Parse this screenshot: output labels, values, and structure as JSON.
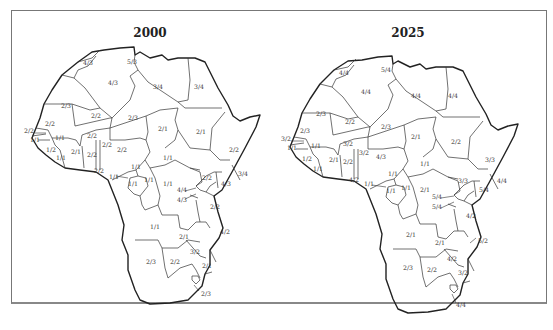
{
  "figure": {
    "panels": [
      {
        "title": "2000",
        "regions": [
          {
            "name": "morocco",
            "code": "4/3",
            "x": 83,
            "y": 65
          },
          {
            "name": "tunisia",
            "code": "5/3",
            "x": 127,
            "y": 64
          },
          {
            "name": "algeria",
            "code": "4/3",
            "x": 108,
            "y": 85
          },
          {
            "name": "libya",
            "code": "3/4",
            "x": 153,
            "y": 89
          },
          {
            "name": "egypt",
            "code": "3/4",
            "x": 194,
            "y": 89
          },
          {
            "name": "western-sahara-mauritania",
            "code": "2/3",
            "x": 61,
            "y": 108
          },
          {
            "name": "mali",
            "code": "2/2",
            "x": 91,
            "y": 118
          },
          {
            "name": "niger",
            "code": "2/3",
            "x": 128,
            "y": 120
          },
          {
            "name": "chad",
            "code": "2/1",
            "x": 158,
            "y": 131
          },
          {
            "name": "sudan",
            "code": "2/1",
            "x": 196,
            "y": 134
          },
          {
            "name": "ethiopia",
            "code": "2/2",
            "x": 229,
            "y": 152
          },
          {
            "name": "senegal",
            "code": "2/2",
            "x": 48,
            "y": 124
          },
          {
            "name": "gambia",
            "code": "2/2",
            "x": 29,
            "y": 131
          },
          {
            "name": "guinea-bissau",
            "code": "1/1",
            "x": 35,
            "y": 139
          },
          {
            "name": "guinea",
            "code": "1/1",
            "x": 57,
            "y": 140
          },
          {
            "name": "sierra-leone",
            "code": "1/2",
            "x": 48,
            "y": 152
          },
          {
            "name": "liberia",
            "code": "1/1",
            "x": 57,
            "y": 160
          },
          {
            "name": "burkina-faso",
            "code": "2/2",
            "x": 89,
            "y": 136
          },
          {
            "name": "cote-divoire",
            "code": "2/1",
            "x": 75,
            "y": 154
          },
          {
            "name": "ghana",
            "code": "2/2",
            "x": 90,
            "y": 156
          },
          {
            "name": "togo-benin",
            "code": "2/2",
            "x": 106,
            "y": 145
          },
          {
            "name": "nigeria",
            "code": "2/2",
            "x": 121,
            "y": 150
          },
          {
            "name": "coast-ghana",
            "code": "2/2",
            "x": 96,
            "y": 173
          },
          {
            "name": "cameroon",
            "code": "1/1",
            "x": 133,
            "y": 169
          },
          {
            "name": "car",
            "code": "1/1",
            "x": 165,
            "y": 160
          },
          {
            "name": "equatorial-guinea",
            "code": "1/1",
            "x": 112,
            "y": 177
          },
          {
            "name": "gabon",
            "code": "1/1",
            "x": 131,
            "y": 185
          },
          {
            "name": "congo",
            "code": "1/1",
            "x": 147,
            "y": 181
          },
          {
            "name": "drc",
            "code": "1/1",
            "x": 165,
            "y": 185
          },
          {
            "name": "uganda",
            "code": "2/2",
            "x": 206,
            "y": 178
          },
          {
            "name": "kenya",
            "code": "4/3",
            "x": 224,
            "y": 185
          },
          {
            "name": "somalia",
            "code": "3/4",
            "x": 243,
            "y": 175
          },
          {
            "name": "rwanda",
            "code": "4/4",
            "x": 181,
            "y": 190
          },
          {
            "name": "burundi",
            "code": "4/3",
            "x": 181,
            "y": 200
          },
          {
            "name": "tanzania",
            "code": "2/2",
            "x": 212,
            "y": 207
          },
          {
            "name": "angola",
            "code": "1/1",
            "x": 154,
            "y": 227
          },
          {
            "name": "zambia",
            "code": "2/1",
            "x": 182,
            "y": 237
          },
          {
            "name": "mozambique",
            "code": "4/2",
            "x": 224,
            "y": 232
          },
          {
            "name": "zimbabwe",
            "code": "3/2",
            "x": 194,
            "y": 252
          },
          {
            "name": "namibia",
            "code": "2/3",
            "x": 150,
            "y": 262
          },
          {
            "name": "botswana",
            "code": "2/2",
            "x": 174,
            "y": 262
          },
          {
            "name": "south-mozambique",
            "code": "2/1",
            "x": 206,
            "y": 266
          },
          {
            "name": "south-africa",
            "code": "2/3",
            "x": 205,
            "y": 294
          }
        ]
      },
      {
        "title": "2025",
        "regions": [
          {
            "name": "morocco",
            "code": "4/4",
            "x": 339,
            "y": 75
          },
          {
            "name": "tunisia",
            "code": "5/4",
            "x": 383,
            "y": 72
          },
          {
            "name": "algeria",
            "code": "4/4",
            "x": 363,
            "y": 93
          },
          {
            "name": "libya",
            "code": "4/4",
            "x": 413,
            "y": 97
          },
          {
            "name": "egypt",
            "code": "4/4",
            "x": 450,
            "y": 97
          },
          {
            "name": "western-sahara-mauritania",
            "code": "2/3",
            "x": 318,
            "y": 114
          },
          {
            "name": "mali",
            "code": "2/2",
            "x": 347,
            "y": 123
          },
          {
            "name": "niger",
            "code": "2/3",
            "x": 383,
            "y": 128
          },
          {
            "name": "chad",
            "code": "2/1",
            "x": 413,
            "y": 138
          },
          {
            "name": "sudan",
            "code": "2/2",
            "x": 453,
            "y": 143
          },
          {
            "name": "ethiopia",
            "code": "3/3",
            "x": 488,
            "y": 161
          },
          {
            "name": "senegal",
            "code": "2/3",
            "x": 302,
            "y": 131
          },
          {
            "name": "gambia",
            "code": "3/2",
            "x": 285,
            "y": 139
          },
          {
            "name": "guinea-bissau",
            "code": "1/1",
            "x": 292,
            "y": 147
          },
          {
            "name": "guinea",
            "code": "1/1",
            "x": 312,
            "y": 146
          },
          {
            "name": "sierra-leone",
            "code": "1/2",
            "x": 305,
            "y": 160
          },
          {
            "name": "liberia",
            "code": "1/1",
            "x": 314,
            "y": 170
          },
          {
            "name": "burkina-faso",
            "code": "3/2",
            "x": 345,
            "y": 146
          },
          {
            "name": "cote-divoire",
            "code": "2/1",
            "x": 331,
            "y": 160
          },
          {
            "name": "ghana",
            "code": "2/2",
            "x": 346,
            "y": 162
          },
          {
            "name": "togo-benin",
            "code": "3/2",
            "x": 362,
            "y": 153
          },
          {
            "name": "nigeria",
            "code": "4/3",
            "x": 379,
            "y": 157
          },
          {
            "name": "coast-ghana",
            "code": "4/2",
            "x": 352,
            "y": 180
          },
          {
            "name": "cameroon",
            "code": "1/1",
            "x": 389,
            "y": 175
          },
          {
            "name": "car",
            "code": "1/1",
            "x": 422,
            "y": 165
          },
          {
            "name": "equatorial-guinea",
            "code": "1/1",
            "x": 368,
            "y": 183
          },
          {
            "name": "gabon",
            "code": "1/1",
            "x": 388,
            "y": 191
          },
          {
            "name": "congo",
            "code": "1/1",
            "x": 403,
            "y": 189
          },
          {
            "name": "drc",
            "code": "2/1",
            "x": 422,
            "y": 191
          },
          {
            "name": "uganda",
            "code": "3/3",
            "x": 463,
            "y": 182
          },
          {
            "name": "kenya",
            "code": "5/4",
            "x": 482,
            "y": 190
          },
          {
            "name": "somalia",
            "code": "4/4",
            "x": 500,
            "y": 182
          },
          {
            "name": "rwanda",
            "code": "5/4",
            "x": 436,
            "y": 197
          },
          {
            "name": "burundi",
            "code": "5/4",
            "x": 436,
            "y": 207
          },
          {
            "name": "tanzania",
            "code": "4/2",
            "x": 467,
            "y": 216
          },
          {
            "name": "angola",
            "code": "2/1",
            "x": 409,
            "y": 236
          },
          {
            "name": "zambia",
            "code": "2/1",
            "x": 437,
            "y": 244
          },
          {
            "name": "mozambique",
            "code": "5/2",
            "x": 481,
            "y": 241
          },
          {
            "name": "zimbabwe",
            "code": "4/2",
            "x": 450,
            "y": 259
          },
          {
            "name": "namibia",
            "code": "2/3",
            "x": 406,
            "y": 268
          },
          {
            "name": "botswana",
            "code": "2/2",
            "x": 430,
            "y": 270
          },
          {
            "name": "south-mozambique",
            "code": "3/2",
            "x": 460,
            "y": 273
          },
          {
            "name": "south-africa",
            "code": "4/4",
            "x": 460,
            "y": 306
          }
        ]
      }
    ]
  }
}
